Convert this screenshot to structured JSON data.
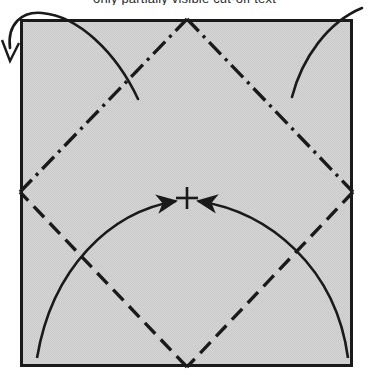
{
  "figure": {
    "caption_clipped": "only partially visible cut-off text",
    "colors": {
      "paper_fill": "#d4d4d4",
      "paper_fill_alt": "#cfcfcf",
      "stroke": "#1a1a1a",
      "background": "#ffffff"
    },
    "paper": {
      "label": "square paper sheet",
      "x": 20,
      "y": 19,
      "width": 333,
      "height": 348,
      "border_width": 3
    },
    "crease_diamond": {
      "label": "inscribed diamond crease lines",
      "vertices": [
        {
          "name": "top-vertex",
          "x": 187,
          "y": 19
        },
        {
          "name": "right-vertex",
          "x": 353,
          "y": 192
        },
        {
          "name": "bottom-vertex",
          "x": 187,
          "y": 367
        },
        {
          "name": "left-vertex",
          "x": 20,
          "y": 192
        }
      ],
      "edges": [
        {
          "name": "upper-left-edge",
          "style": "dash-dot",
          "dasharray": "17 6 3 6"
        },
        {
          "name": "upper-right-edge",
          "style": "dash-dot",
          "dasharray": "17 6 3 6"
        },
        {
          "name": "lower-right-edge",
          "style": "dashed",
          "dasharray": "15 8"
        },
        {
          "name": "lower-left-edge",
          "style": "dashed",
          "dasharray": "15 8"
        }
      ]
    },
    "center_mark": {
      "label": "center cross registration mark",
      "x": 187,
      "y": 198,
      "arm_length": 11
    },
    "fold_arrows": [
      {
        "name": "left-fold-arrow",
        "description": "arc sweeping from lower-left corner up to the center mark",
        "path": "M 37 358 C 52 268, 110 212, 174 201",
        "arrowhead": "filled",
        "arrowhead_x": 178,
        "arrowhead_y": 200
      },
      {
        "name": "right-fold-arrow",
        "description": "arc sweeping from lower-right corner up to the center mark",
        "path": "M 348 358 C 336 268, 270 212, 200 201",
        "arrowhead": "filled",
        "arrowhead_x": 196,
        "arrowhead_y": 200
      }
    ],
    "outer_curves": [
      {
        "name": "top-left-outer-curve",
        "description": "curve leaving the sheet toward the upper-left, ending in an open arrowhead",
        "path": "M 136 97 C 112 52, 74 17, 40 14 C 20 12, 8 24, 10 46",
        "arrowhead": "open",
        "arrowhead_x": 10,
        "arrowhead_y": 53
      },
      {
        "name": "top-right-outer-curve",
        "description": "curve leaving the sheet toward the upper-right off the top edge",
        "path": "M 292 96 C 304 56, 330 22, 360 10",
        "arrowhead": "none"
      }
    ]
  }
}
